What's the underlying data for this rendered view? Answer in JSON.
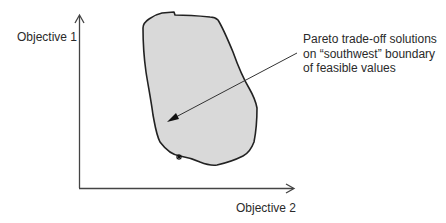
{
  "diagram": {
    "type": "pareto-front-illustration",
    "axes": {
      "y_label": "Objective 1",
      "x_label": "Objective 2"
    },
    "annotation": {
      "lines": [
        "Pareto trade-off solutions",
        "on “southwest” boundary",
        "of feasible values"
      ]
    },
    "region": {
      "name": "feasible values",
      "fill": "#d9d9d9",
      "stroke": "#222222"
    },
    "marker": {
      "symbol": "*",
      "meaning": "point on southwest boundary"
    },
    "colors": {
      "axis": "#444444",
      "text": "#2a2a2a",
      "arrow": "#333333"
    }
  }
}
